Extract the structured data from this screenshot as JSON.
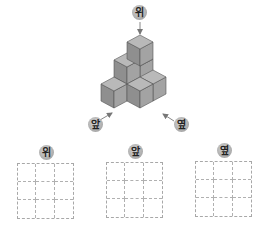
{
  "figure": {
    "cubes": [
      {
        "x": 140,
        "y": 100
      },
      {
        "x": 127,
        "y": 101
      },
      {
        "x": 140,
        "y": 83
      },
      {
        "x": 127,
        "y": 84
      },
      {
        "x": 140,
        "y": 66
      },
      {
        "x": 153,
        "y": 101
      },
      {
        "x": 114,
        "y": 108
      },
      {
        "x": 140,
        "y": 108
      }
    ],
    "colors": {
      "top": "#b9b9b9",
      "left": "#8f8f8f",
      "right": "#a3a3a3",
      "edge": "#555555"
    },
    "labels": {
      "top": "위",
      "front": "앞",
      "side": "옆"
    }
  },
  "answer_grids": [
    {
      "label": "위",
      "rows": 3,
      "cols": 3
    },
    {
      "label": "앞",
      "rows": 3,
      "cols": 3
    },
    {
      "label": "옆",
      "rows": 3,
      "cols": 3
    }
  ]
}
